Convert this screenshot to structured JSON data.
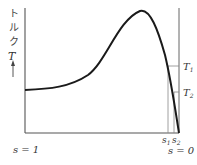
{
  "diagram": {
    "type": "torque-slip curve",
    "y_axis_label_jp": [
      "ト",
      "ル",
      "ク"
    ],
    "y_axis_symbol": "T",
    "y_axis_arrow": "up-arrow",
    "x_left_label": "s = 1",
    "x_right_label": "s = 0",
    "markers": {
      "T1": {
        "label": "T",
        "sub": "1"
      },
      "T2": {
        "label": "T",
        "sub": "2"
      },
      "s1": {
        "label": "s",
        "sub": "1"
      },
      "s2": {
        "label": "s",
        "sub": "2"
      }
    },
    "colors": {
      "curve": "#1a1a1a",
      "axis": "#555555",
      "guide": "#888888",
      "text": "#333333"
    }
  }
}
